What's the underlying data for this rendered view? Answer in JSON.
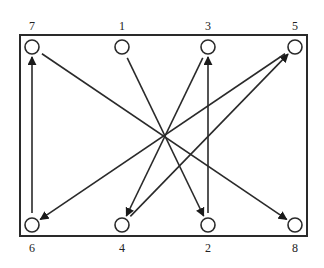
{
  "diagram": {
    "type": "directed-graph",
    "frame": {
      "x": 20,
      "y": 35,
      "width": 287,
      "height": 201
    },
    "colors": {
      "stroke": "#2a2a2a",
      "background": "#ffffff",
      "text": "#222222"
    },
    "nodes": [
      {
        "id": "7",
        "label": "7",
        "cx": 32,
        "cy": 47,
        "label_pos": "above"
      },
      {
        "id": "1",
        "label": "1",
        "cx": 122,
        "cy": 47,
        "label_pos": "above"
      },
      {
        "id": "3",
        "label": "3",
        "cx": 208,
        "cy": 47,
        "label_pos": "above"
      },
      {
        "id": "5",
        "label": "5",
        "cx": 295,
        "cy": 47,
        "label_pos": "above"
      },
      {
        "id": "6",
        "label": "6",
        "cx": 32,
        "cy": 225,
        "label_pos": "below"
      },
      {
        "id": "4",
        "label": "4",
        "cx": 122,
        "cy": 225,
        "label_pos": "below"
      },
      {
        "id": "2",
        "label": "2",
        "cx": 208,
        "cy": 225,
        "label_pos": "below"
      },
      {
        "id": "8",
        "label": "8",
        "cx": 295,
        "cy": 225,
        "label_pos": "below"
      }
    ],
    "edges": [
      {
        "from": "1",
        "to": "2"
      },
      {
        "from": "2",
        "to": "3"
      },
      {
        "from": "3",
        "to": "4"
      },
      {
        "from": "4",
        "to": "5"
      },
      {
        "from": "5",
        "to": "6"
      },
      {
        "from": "6",
        "to": "7"
      },
      {
        "from": "7",
        "to": "8"
      }
    ]
  }
}
